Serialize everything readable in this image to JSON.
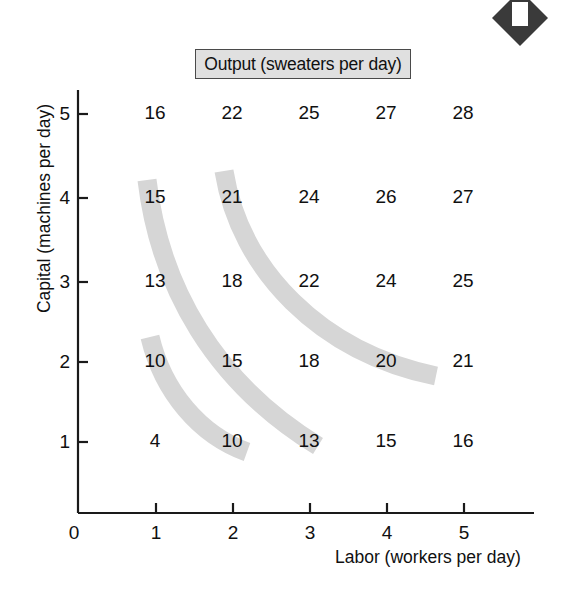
{
  "title": "Output (sweaters per day)",
  "axes": {
    "x_title": "Labor (workers per day)",
    "y_title": "Capital (machines per day)",
    "origin_label": "0",
    "x_ticks": [
      "1",
      "2",
      "3",
      "4",
      "5"
    ],
    "y_ticks": [
      "1",
      "2",
      "3",
      "4",
      "5"
    ]
  },
  "marker": {
    "name": "diamond-marker",
    "fill": "#3a3a3a"
  },
  "colors": {
    "isoquant": "#d6d6d6",
    "ink": "#101010",
    "title_box_fill": "#e0e0e0",
    "title_box_border": "#4a4a4a"
  },
  "chart_data": {
    "type": "heatmap",
    "title": "Output (sweaters per day)",
    "xlabel": "Labor (workers per day)",
    "ylabel": "Capital (machines per day)",
    "xlim": [
      0,
      5.8
    ],
    "ylim": [
      0,
      5.6
    ],
    "grid": false,
    "legend": "none",
    "x": [
      1,
      2,
      3,
      4,
      5
    ],
    "y": [
      1,
      2,
      3,
      4,
      5
    ],
    "row_labels": [
      "5",
      "4",
      "3",
      "2",
      "1"
    ],
    "rows": [
      {
        "capital": 5,
        "values": [
          16,
          22,
          25,
          27,
          28
        ]
      },
      {
        "capital": 4,
        "values": [
          15,
          21,
          24,
          26,
          27
        ]
      },
      {
        "capital": 3,
        "values": [
          13,
          18,
          22,
          24,
          25
        ]
      },
      {
        "capital": 2,
        "values": [
          10,
          15,
          18,
          20,
          21
        ]
      },
      {
        "capital": 1,
        "values": [
          4,
          10,
          13,
          15,
          16
        ]
      }
    ],
    "annotations": [
      {
        "name": "isoquant-10",
        "output": 10,
        "passes_through": [
          [
            1,
            2
          ],
          [
            2,
            1
          ]
        ]
      },
      {
        "name": "isoquant-15",
        "output": 15,
        "passes_through": [
          [
            1,
            4
          ],
          [
            2,
            2
          ],
          [
            4,
            1
          ]
        ]
      },
      {
        "name": "isoquant-21",
        "output": 21,
        "passes_through": [
          [
            2,
            4
          ],
          [
            3,
            3
          ],
          [
            5,
            2
          ]
        ]
      }
    ]
  },
  "cells": [
    {
      "label": "16",
      "x": 155,
      "y": 115
    },
    {
      "label": "22",
      "x": 232,
      "y": 115
    },
    {
      "label": "25",
      "x": 309,
      "y": 115
    },
    {
      "label": "27",
      "x": 386,
      "y": 115
    },
    {
      "label": "28",
      "x": 463,
      "y": 115
    },
    {
      "label": "15",
      "x": 155,
      "y": 199
    },
    {
      "label": "21",
      "x": 232,
      "y": 199
    },
    {
      "label": "24",
      "x": 309,
      "y": 199
    },
    {
      "label": "26",
      "x": 386,
      "y": 199
    },
    {
      "label": "27",
      "x": 463,
      "y": 199
    },
    {
      "label": "13",
      "x": 155,
      "y": 283
    },
    {
      "label": "18",
      "x": 232,
      "y": 283
    },
    {
      "label": "22",
      "x": 309,
      "y": 283
    },
    {
      "label": "24",
      "x": 386,
      "y": 283
    },
    {
      "label": "25",
      "x": 463,
      "y": 283
    },
    {
      "label": "10",
      "x": 155,
      "y": 363
    },
    {
      "label": "15",
      "x": 232,
      "y": 363
    },
    {
      "label": "18",
      "x": 309,
      "y": 363
    },
    {
      "label": "20",
      "x": 386,
      "y": 363
    },
    {
      "label": "21",
      "x": 463,
      "y": 363
    },
    {
      "label": "4",
      "x": 155,
      "y": 443
    },
    {
      "label": "10",
      "x": 232,
      "y": 443
    },
    {
      "label": "13",
      "x": 309,
      "y": 443
    },
    {
      "label": "15",
      "x": 386,
      "y": 443
    },
    {
      "label": "16",
      "x": 463,
      "y": 443
    }
  ],
  "tick_positions": {
    "x": [
      {
        "label": "0",
        "left": 59,
        "top": 522
      },
      {
        "label": "1",
        "left": 141,
        "top": 522
      },
      {
        "label": "2",
        "left": 218,
        "top": 522
      },
      {
        "label": "3",
        "left": 295,
        "top": 522
      },
      {
        "label": "4",
        "left": 372,
        "top": 522
      },
      {
        "label": "5",
        "left": 449,
        "top": 522
      }
    ],
    "y": [
      {
        "label": "5",
        "left": 46,
        "top": 103
      },
      {
        "label": "4",
        "left": 46,
        "top": 187
      },
      {
        "label": "3",
        "left": 46,
        "top": 271
      },
      {
        "label": "2",
        "left": 46,
        "top": 351
      },
      {
        "label": "1",
        "left": 46,
        "top": 431
      }
    ]
  }
}
